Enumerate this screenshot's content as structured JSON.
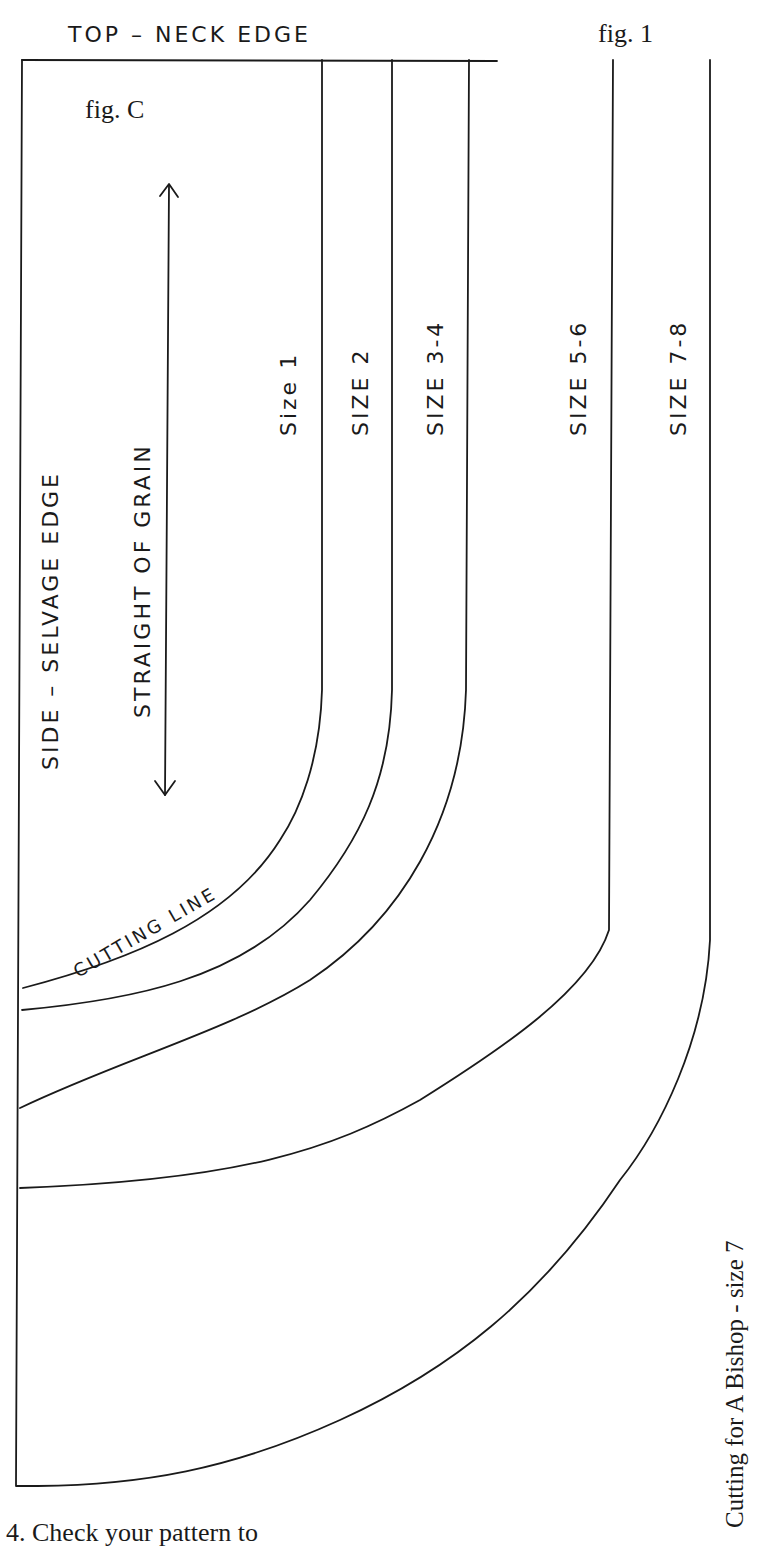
{
  "header": {
    "top_edge_label": "TOP  –  NECK EDGE",
    "figure_number": "fig. 1"
  },
  "diagram": {
    "figure_label": "fig. C",
    "side_label": "SIDE  –  SELVAGE EDGE",
    "grain_label": "STRAIGHT OF GRAIN",
    "cutting_line_label": "CUTTING LINE",
    "size_labels": [
      "Size 1",
      "SIZE 2",
      "SIZE 3-4",
      "SIZE 5-6",
      "SIZE 7-8"
    ],
    "caption_vertical": "Cutting for  A Bishop - size 7"
  },
  "footer": {
    "instruction_partial": "4. Check your pattern to"
  }
}
